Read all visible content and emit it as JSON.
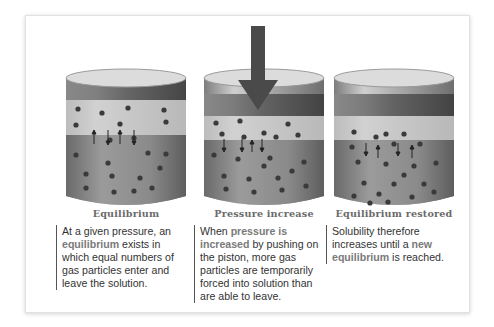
{
  "figure": {
    "panels": [
      {
        "id": "equilibrium",
        "title": "Equilibrium",
        "description_parts": [
          {
            "text": "At a given pressure, an ",
            "highlight": false
          },
          {
            "text": "equilibrium",
            "highlight": true
          },
          {
            "text": " exists in which equal numbers of gas particles enter and leave the solution.",
            "highlight": false
          }
        ],
        "piston_arrow": false
      },
      {
        "id": "pressure-increase",
        "title": "Pressure increase",
        "description_parts": [
          {
            "text": "When ",
            "highlight": false
          },
          {
            "text": "pressure is increased",
            "highlight": true
          },
          {
            "text": " by pushing on the piston, more gas particles are temporarily forced into solution than are able to leave.",
            "highlight": false
          }
        ],
        "piston_arrow": true
      },
      {
        "id": "equilibrium-restored",
        "title": "Equilibrium restored",
        "description_parts": [
          {
            "text": "Solubility therefore increases until a ",
            "highlight": false
          },
          {
            "text": "new equilibrium",
            "highlight": true
          },
          {
            "text": " is reached.",
            "highlight": false
          }
        ],
        "piston_arrow": false
      }
    ],
    "colors": {
      "card_background": "#ffffff",
      "cylinder_glass": "#b8b8b8",
      "liquid": "#8c8c8c",
      "gas_space": "#cfcfcf",
      "piston": "#6f6f6f",
      "particle": "#3a3a3a",
      "arrow": "#4a4a4a",
      "caption_text": "#6a6a6a",
      "body_text": "#333333",
      "highlight_text": "#7a7a7a"
    }
  }
}
